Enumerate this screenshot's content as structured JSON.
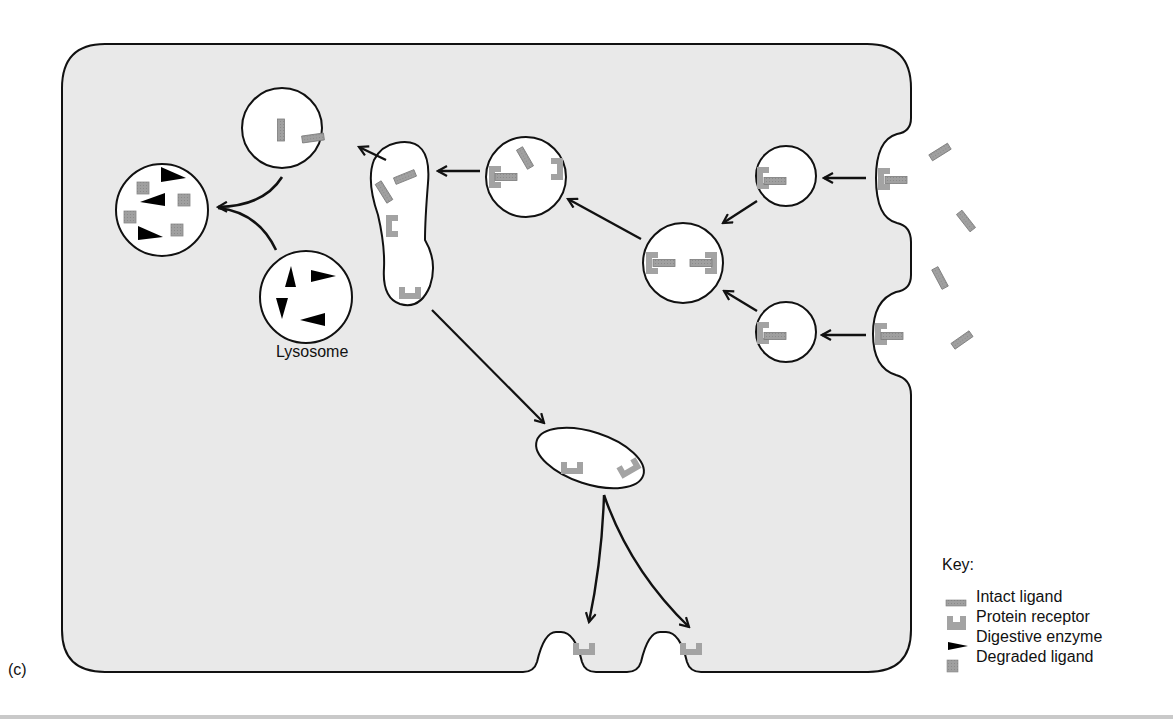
{
  "figure": {
    "panel_label": "(c)",
    "colors": {
      "cytoplasm": "#e9e9e9",
      "membrane": "#111111",
      "vesicle_fill": "#ffffff",
      "ligand": "#9a9a9a",
      "receptor": "#a3a3a3",
      "enzyme": "#000000",
      "background": "#ffffff"
    }
  },
  "labels": {
    "lysosome": "Lysosome"
  },
  "key": {
    "title": "Key:",
    "items": [
      {
        "symbol": "intact-ligand-icon",
        "label": "Intact ligand"
      },
      {
        "symbol": "protein-receptor-icon",
        "label": "Protein receptor"
      },
      {
        "symbol": "digestive-enzyme-icon",
        "label": "Digestive enzyme"
      },
      {
        "symbol": "degraded-ligand-icon",
        "label": "Degraded ligand"
      }
    ]
  },
  "structures": [
    {
      "id": "coated-pit-upper",
      "type": "membrane invagination with receptor-bound ligand"
    },
    {
      "id": "coated-pit-lower",
      "type": "membrane invagination with receptor-bound ligand"
    },
    {
      "id": "vesicle-upper",
      "type": "endocytic vesicle"
    },
    {
      "id": "vesicle-lower",
      "type": "endocytic vesicle"
    },
    {
      "id": "fused-vesicle",
      "type": "fused endosome"
    },
    {
      "id": "endosome",
      "type": "endosome, ligand dissociating"
    },
    {
      "id": "sorting-compartment",
      "type": "tubular endosome"
    },
    {
      "id": "ligand-vesicle",
      "type": "vesicle with free ligands"
    },
    {
      "id": "lysosome",
      "type": "lysosome with digestive enzymes"
    },
    {
      "id": "secondary-lysosome",
      "type": "digesting vesicle with degraded ligand"
    },
    {
      "id": "recycling-vesicle",
      "type": "receptor recycling vesicle"
    },
    {
      "id": "recycled-receptor-sites",
      "type": "membrane evaginations with returned receptors",
      "count": 2
    }
  ],
  "extracellular_ligands": 4
}
